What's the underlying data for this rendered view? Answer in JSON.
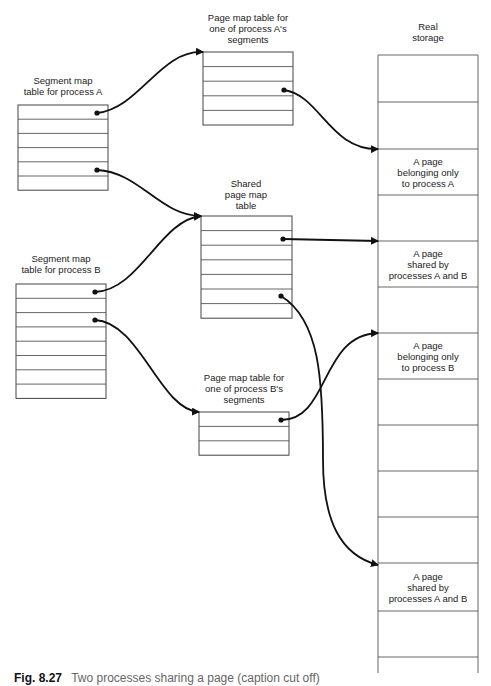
{
  "figure": {
    "caption_number": "Fig. 8.27",
    "caption_text": "Two processes sharing a page (caption cut off)"
  },
  "tables": {
    "segment_a": {
      "title_lines": [
        "Segment map",
        "table for process A"
      ],
      "rows": 6
    },
    "segment_b": {
      "title_lines": [
        "Segment map",
        "table for process B"
      ],
      "rows": 8
    },
    "page_a": {
      "title_lines": [
        "Page map table for",
        "one of process A's",
        "segments"
      ],
      "rows": 5
    },
    "shared": {
      "title_lines": [
        "Shared",
        "page map",
        "table"
      ],
      "rows": 7
    },
    "page_b": {
      "title_lines": [
        "Page map table for",
        "one of process B's",
        "segments"
      ],
      "rows": 3
    }
  },
  "storage": {
    "title_lines": [
      "Real",
      "storage"
    ],
    "frames": [
      {
        "text": []
      },
      {
        "text": []
      },
      {
        "text": [
          "A page",
          "belonging only",
          "to process A"
        ]
      },
      {
        "text": []
      },
      {
        "text": [
          "A page",
          "shared by",
          "processes A and B"
        ]
      },
      {
        "text": []
      },
      {
        "text": [
          "A page",
          "belonging only",
          "to process B"
        ]
      },
      {
        "text": []
      },
      {
        "text": []
      },
      {
        "text": []
      },
      {
        "text": []
      },
      {
        "text": [
          "A page",
          "shared by",
          "processes A and B"
        ]
      },
      {
        "text": []
      },
      {
        "text": []
      }
    ]
  },
  "links": [
    {
      "from": "segment_a.row0",
      "to": "page_a"
    },
    {
      "from": "segment_a.row4",
      "to": "shared"
    },
    {
      "from": "segment_b.row0",
      "to": "shared"
    },
    {
      "from": "segment_b.row2",
      "to": "page_b"
    },
    {
      "from": "page_a.row2",
      "to": "storage.frame2"
    },
    {
      "from": "shared.row1",
      "to": "storage.frame4"
    },
    {
      "from": "shared.row5",
      "to": "storage.frame11"
    },
    {
      "from": "page_b.row0",
      "to": "storage.frame6"
    }
  ]
}
